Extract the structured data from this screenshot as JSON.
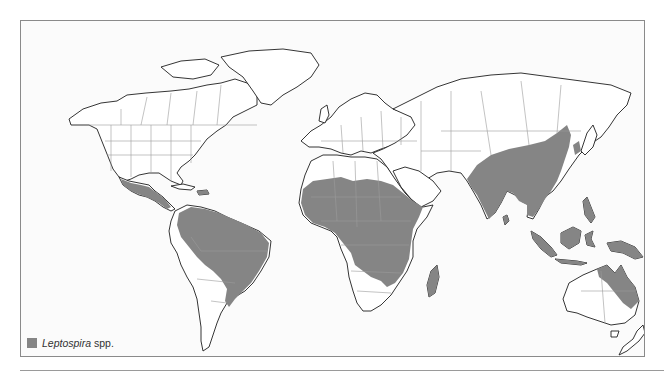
{
  "map": {
    "title": "Global distribution of Leptospira spp.",
    "colors": {
      "endemic_fill": "#858585",
      "land_fill": "#ffffff",
      "coastline": "#1e1e1e",
      "borders": "#9a9a9a",
      "background": "#fbfbfb"
    },
    "endemic_regions": [
      "Mexico and Central America",
      "Caribbean (Cuba, Hispaniola)",
      "Northern and central South America (Amazon basin, Brazil)",
      "Sub-Saharan Africa (Sahel to central/eastern Africa)",
      "Madagascar",
      "South Asia (India, Sri Lanka)",
      "China and Korea",
      "Southeast Asia",
      "Indonesia, Philippines, Papua New Guinea",
      "Northeastern Australia"
    ]
  },
  "legend": {
    "items": [
      {
        "label_italic": "Leptospira",
        "label_suffix": " spp.",
        "color": "#858585"
      }
    ]
  }
}
